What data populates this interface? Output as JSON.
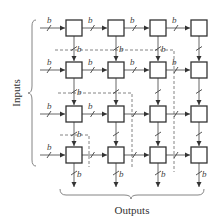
{
  "diagram": {
    "type": "systolic-array",
    "rows": 4,
    "cols": 4,
    "bus_width_label": "b",
    "labels": {
      "inputs": "Inputs",
      "outputs": "Outputs"
    },
    "colors": {
      "box_stroke": "#333333",
      "line": "#555555",
      "dashed": "#777777",
      "text": "#333333"
    },
    "grid": {
      "col_x": [
        66,
        108,
        150,
        191
      ],
      "row_y": [
        20,
        62,
        106,
        147
      ],
      "box_size": 16
    },
    "input_b_labels_per_row": [
      4,
      4,
      2,
      1
    ],
    "vertical_b_labels_per_row": [
      3,
      0,
      1,
      1
    ],
    "dashed_regions": [
      {
        "name": "large",
        "h_y": 50,
        "x1": 55,
        "x2": 174,
        "y2": 172
      },
      {
        "name": "medium",
        "h_y": 93,
        "x1": 58,
        "x2": 132,
        "y2": 169
      },
      {
        "name": "small",
        "h_y": 135,
        "x1": 60,
        "x2": 89,
        "y2": 167
      }
    ]
  }
}
